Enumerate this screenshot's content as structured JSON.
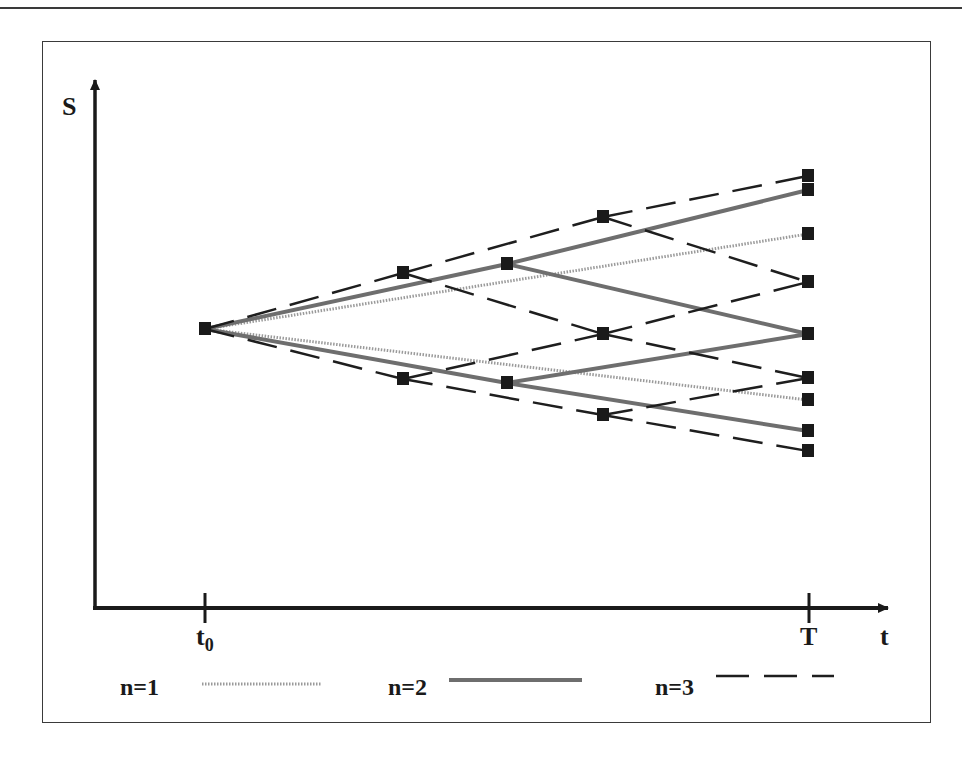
{
  "diagram": {
    "title": "",
    "axes": {
      "y_label": "S",
      "x_label": "t",
      "x_ticks": [
        {
          "label": "t",
          "subscript": "0",
          "x": 205
        },
        {
          "label": "T",
          "subscript": "",
          "x": 808
        }
      ]
    },
    "legend": [
      {
        "label": "n=1",
        "style": "dotted",
        "color": "#9a9a9a"
      },
      {
        "label": "n=2",
        "style": "solid",
        "color": "#6e6e6e"
      },
      {
        "label": "n=3",
        "style": "dashed",
        "color": "#1e1e1e"
      }
    ],
    "root_node": {
      "x": 205,
      "y": 329
    },
    "trees": [
      {
        "name": "n=1",
        "steps": 1,
        "nodes": [
          [
            [
              205,
              329
            ]
          ],
          [
            [
              808,
              234
            ],
            [
              808,
              400
            ]
          ]
        ]
      },
      {
        "name": "n=2",
        "steps": 2,
        "nodes": [
          [
            [
              205,
              329
            ]
          ],
          [
            [
              507,
              264
            ],
            [
              507,
              383
            ]
          ],
          [
            [
              808,
              190
            ],
            [
              808,
              334
            ],
            [
              808,
              431
            ]
          ]
        ]
      },
      {
        "name": "n=3",
        "steps": 3,
        "nodes": [
          [
            [
              205,
              329
            ]
          ],
          [
            [
              403,
              273
            ],
            [
              403,
              379
            ]
          ],
          [
            [
              603,
              217
            ],
            [
              603,
              334
            ],
            [
              603,
              415
            ]
          ],
          [
            [
              808,
              176
            ],
            [
              808,
              282
            ],
            [
              808,
              378
            ],
            [
              808,
              451
            ]
          ]
        ]
      }
    ]
  }
}
